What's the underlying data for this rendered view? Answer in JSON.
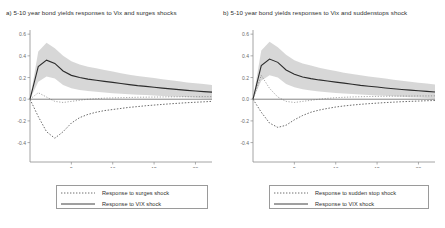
{
  "figure": {
    "background": "#ffffff",
    "band_color": "#c9c9c9",
    "line_color": "#2b2b2b",
    "axis_color": "#8d8d8d"
  },
  "panels": [
    {
      "key": "panel-a",
      "label": "a)",
      "title": "a) 5-10 year bond yields responses to Vix and surges shocks",
      "legend": [
        {
          "label": "Response to surges shock",
          "style": "dotted"
        },
        {
          "label": "Response to VIX shock",
          "style": "solid"
        }
      ]
    },
    {
      "key": "panel-b",
      "label": "b)",
      "title": "b) 5-10 year bond yields responses to Vix and suddenstops shock",
      "legend": [
        {
          "label": "Response to sudden stop shock",
          "style": "dotted"
        },
        {
          "label": "Response to VIX shock",
          "style": "solid"
        }
      ]
    }
  ],
  "chart_data": [
    {
      "type": "line",
      "title": "a) 5-10 year bond yields responses to Vix and surges shocks",
      "xlabel": "",
      "ylabel": "",
      "xlim": [
        0,
        22
      ],
      "ylim": [
        -0.45,
        0.62
      ],
      "xticks": [
        5,
        10,
        15,
        20
      ],
      "yticks": [
        -0.4,
        -0.2,
        0.0,
        0.2,
        0.4,
        0.6
      ],
      "grid": false,
      "legend_position": "below-axes",
      "zero_line": 0.0,
      "x": [
        0,
        1,
        2,
        3,
        4,
        5,
        6,
        7,
        8,
        9,
        10,
        11,
        12,
        13,
        14,
        15,
        16,
        17,
        18,
        19,
        20,
        21,
        22
      ],
      "series": [
        {
          "name": "Response to VIX shock",
          "style": "solid",
          "values": [
            0.0,
            0.3,
            0.36,
            0.33,
            0.26,
            0.22,
            0.2,
            0.185,
            0.175,
            0.165,
            0.155,
            0.145,
            0.135,
            0.125,
            0.118,
            0.11,
            0.102,
            0.095,
            0.088,
            0.082,
            0.076,
            0.07,
            0.065
          ],
          "band_upper": [
            0.0,
            0.44,
            0.52,
            0.47,
            0.4,
            0.35,
            0.32,
            0.3,
            0.285,
            0.27,
            0.255,
            0.24,
            0.225,
            0.215,
            0.205,
            0.195,
            0.185,
            0.175,
            0.165,
            0.155,
            0.148,
            0.14,
            0.132
          ],
          "band_lower": [
            0.0,
            0.16,
            0.21,
            0.19,
            0.13,
            0.1,
            0.085,
            0.075,
            0.068,
            0.062,
            0.056,
            0.05,
            0.046,
            0.042,
            0.038,
            0.034,
            0.03,
            0.026,
            0.022,
            0.018,
            0.014,
            0.01,
            0.006
          ]
        },
        {
          "name": "Response to surges shock",
          "style": "dotted",
          "values": [
            0.0,
            -0.16,
            -0.3,
            -0.36,
            -0.3,
            -0.22,
            -0.17,
            -0.14,
            -0.12,
            -0.105,
            -0.095,
            -0.085,
            -0.075,
            -0.068,
            -0.06,
            -0.054,
            -0.048,
            -0.042,
            -0.037,
            -0.032,
            -0.028,
            -0.024,
            -0.02
          ]
        },
        {
          "name": "upper dotted envelope",
          "style": "dotted-thin",
          "values": [
            0.0,
            0.06,
            0.02,
            -0.02,
            -0.03,
            -0.02,
            -0.01,
            0.0,
            0.005,
            0.01,
            0.012,
            0.014,
            0.016,
            0.018,
            0.019,
            0.02,
            0.021,
            0.022,
            0.022,
            0.023,
            0.023,
            0.024,
            0.024
          ]
        }
      ]
    },
    {
      "type": "line",
      "title": "b) 5-10 year bond yields responses to Vix and suddenstops shock",
      "xlabel": "",
      "ylabel": "",
      "xlim": [
        0,
        22
      ],
      "ylim": [
        -0.45,
        0.62
      ],
      "xticks": [
        5,
        10,
        15,
        20
      ],
      "yticks": [
        -0.4,
        -0.2,
        0.0,
        0.2,
        0.4,
        0.6
      ],
      "grid": false,
      "legend_position": "below-axes",
      "zero_line": 0.0,
      "x": [
        0,
        1,
        2,
        3,
        4,
        5,
        6,
        7,
        8,
        9,
        10,
        11,
        12,
        13,
        14,
        15,
        16,
        17,
        18,
        19,
        20,
        21,
        22
      ],
      "series": [
        {
          "name": "Response to VIX shock",
          "style": "solid",
          "values": [
            0.0,
            0.31,
            0.37,
            0.34,
            0.27,
            0.23,
            0.205,
            0.19,
            0.178,
            0.168,
            0.158,
            0.148,
            0.138,
            0.128,
            0.12,
            0.112,
            0.104,
            0.097,
            0.09,
            0.084,
            0.078,
            0.072,
            0.066
          ],
          "band_upper": [
            0.0,
            0.45,
            0.53,
            0.48,
            0.41,
            0.36,
            0.33,
            0.31,
            0.29,
            0.275,
            0.26,
            0.245,
            0.232,
            0.22,
            0.21,
            0.2,
            0.19,
            0.18,
            0.17,
            0.16,
            0.152,
            0.144,
            0.136
          ],
          "band_lower": [
            0.0,
            0.17,
            0.22,
            0.2,
            0.14,
            0.11,
            0.092,
            0.08,
            0.072,
            0.065,
            0.058,
            0.052,
            0.047,
            0.043,
            0.039,
            0.035,
            0.031,
            0.027,
            0.023,
            0.019,
            0.015,
            0.011,
            0.007
          ]
        },
        {
          "name": "Response to sudden stop shock",
          "style": "dotted",
          "values": [
            0.0,
            -0.12,
            -0.22,
            -0.26,
            -0.24,
            -0.19,
            -0.15,
            -0.12,
            -0.1,
            -0.085,
            -0.072,
            -0.062,
            -0.054,
            -0.047,
            -0.041,
            -0.036,
            -0.031,
            -0.027,
            -0.023,
            -0.02,
            -0.017,
            -0.014,
            -0.012
          ]
        },
        {
          "name": "upper dotted envelope",
          "style": "dotted-thin",
          "values": [
            0.0,
            0.22,
            0.1,
            0.02,
            -0.02,
            -0.03,
            -0.02,
            -0.01,
            0.0,
            0.008,
            0.014,
            0.018,
            0.021,
            0.023,
            0.025,
            0.026,
            0.027,
            0.028,
            0.029,
            0.029,
            0.03,
            0.03,
            0.031
          ]
        }
      ]
    }
  ]
}
